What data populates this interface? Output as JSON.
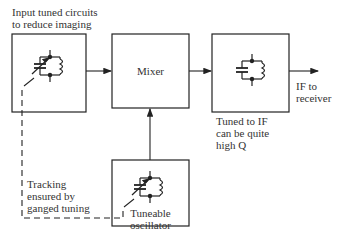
{
  "blocks": {
    "input": {
      "label_line1": "Input tuned circuits",
      "label_line2": "to reduce imaging"
    },
    "mixer": {
      "label": "Mixer"
    },
    "if_filter": {
      "label_line1": "Tuned to IF",
      "label_line2": "can be quite",
      "label_line3": "high Q"
    },
    "oscillator": {
      "label_line1": "Tuneable",
      "label_line2": "oscillator"
    }
  },
  "output": {
    "label_line1": "IF to",
    "label_line2": "receiver"
  },
  "tracking_note": {
    "line1": "Tracking",
    "line2": "ensured by",
    "line3": "ganged tuning"
  },
  "colors": {
    "stroke": "#222222",
    "background": "#ffffff"
  }
}
